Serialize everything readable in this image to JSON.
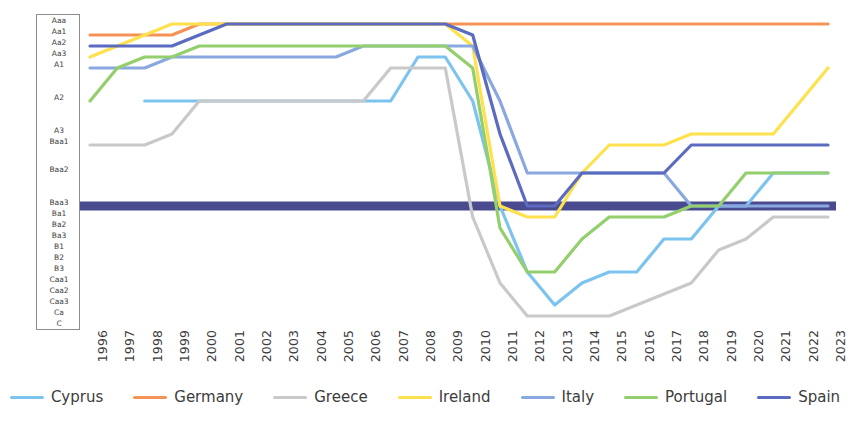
{
  "chart_data": {
    "type": "line",
    "title": "",
    "subtitle": "",
    "xlabel": "",
    "ylabel": "",
    "grid": false,
    "legend_position": "bottom",
    "x": [
      "1996",
      "1997",
      "1998",
      "1999",
      "2000",
      "2001",
      "2002",
      "2003",
      "2004",
      "2005",
      "2006",
      "2007",
      "2008",
      "2009",
      "2010",
      "2011",
      "2012",
      "2013",
      "2014",
      "2015",
      "2016",
      "2017",
      "2018",
      "2019",
      "2020",
      "2021",
      "2022",
      "2023"
    ],
    "y_categories": [
      "Aaa",
      "Aa1",
      "Aa2",
      "Aa3",
      "A1",
      "A2",
      "A3",
      "Baa1",
      "Baa2",
      "Baa3",
      "Ba1",
      "Ba2",
      "Ba3",
      "B1",
      "B2",
      "B3",
      "Caa1",
      "Caa2",
      "Caa3",
      "Ca",
      "C"
    ],
    "y_label_rows": [
      {
        "label": "Aaa",
        "y": 20
      },
      {
        "label": "Aa1",
        "y": 31
      },
      {
        "label": "Aa2",
        "y": 42
      },
      {
        "label": "Aa3",
        "y": 53
      },
      {
        "label": "A1",
        "y": 64
      },
      {
        "label": "A2",
        "y": 97
      },
      {
        "label": "A3",
        "y": 130
      },
      {
        "label": "Baa1",
        "y": 141
      },
      {
        "label": "Baa2",
        "y": 169
      },
      {
        "label": "Baa3",
        "y": 202
      },
      {
        "label": "Ba1",
        "y": 213
      },
      {
        "label": "Ba2",
        "y": 224
      },
      {
        "label": "Ba3",
        "y": 235
      },
      {
        "label": "B1",
        "y": 246
      },
      {
        "label": "B2",
        "y": 257
      },
      {
        "label": "B3",
        "y": 268
      },
      {
        "label": "Caa1",
        "y": 279
      },
      {
        "label": "Caa2",
        "y": 290
      },
      {
        "label": "Caa3",
        "y": 301
      },
      {
        "label": "Ca",
        "y": 312
      },
      {
        "label": "C",
        "y": 323
      }
    ],
    "series": [
      {
        "name": "Cyprus",
        "color": "#7cc4ef",
        "values": [
          null,
          null,
          "A2",
          "A2",
          "A2",
          "A2",
          "A2",
          "A2",
          "A2",
          "A2",
          "A2",
          "A2",
          "Aa3",
          "Aa3",
          "A2",
          "Baa3",
          "B3",
          "Caa3",
          "Caa1",
          "B3",
          "B3",
          "Ba3",
          "Ba3",
          "Baa3",
          "Baa3",
          "Baa2",
          "Baa2",
          "Baa2"
        ]
      },
      {
        "name": "Germany",
        "color": "#f59356",
        "values": [
          "Aa1",
          "Aa1",
          "Aa1",
          "Aa1",
          "Aaa",
          "Aaa",
          "Aaa",
          "Aaa",
          "Aaa",
          "Aaa",
          "Aaa",
          "Aaa",
          "Aaa",
          "Aaa",
          "Aaa",
          "Aaa",
          "Aaa",
          "Aaa",
          "Aaa",
          "Aaa",
          "Aaa",
          "Aaa",
          "Aaa",
          "Aaa",
          "Aaa",
          "Aaa",
          "Aaa",
          "Aaa"
        ]
      },
      {
        "name": "Greece",
        "color": "#c9c9c9",
        "values": [
          "Baa1",
          "Baa1",
          "Baa1",
          "A3",
          "A2",
          "A2",
          "A2",
          "A2",
          "A2",
          "A2",
          "A2",
          "A1",
          "A1",
          "A1",
          "Ba1",
          "Caa1",
          "Ca",
          "Ca",
          "Ca",
          "Ca",
          "Caa3",
          "Caa2",
          "Caa1",
          "B1",
          "Ba3",
          "Ba1",
          "Ba1",
          "Ba1"
        ]
      },
      {
        "name": "Ireland",
        "color": "#ffe14d",
        "values": [
          "Aa3",
          "Aa2",
          "Aa1",
          "Aaa",
          "Aaa",
          "Aaa",
          "Aaa",
          "Aaa",
          "Aaa",
          "Aaa",
          "Aaa",
          "Aaa",
          "Aaa",
          "Aaa",
          "Aa2",
          "Baa3",
          "Ba1",
          "Ba1",
          "Baa2",
          "Baa1",
          "Baa1",
          "Baa1",
          "A3",
          "A3",
          "A3",
          "A3",
          "A2",
          "A1"
        ]
      },
      {
        "name": "Italy",
        "color": "#8aa8e0",
        "values": [
          "A1",
          "A1",
          "A1",
          "Aa3",
          "Aa3",
          "Aa3",
          "Aa3",
          "Aa3",
          "Aa3",
          "Aa3",
          "Aa2",
          "Aa2",
          "Aa2",
          "Aa2",
          "Aa2",
          "A2",
          "Baa2",
          "Baa2",
          "Baa2",
          "Baa2",
          "Baa2",
          "Baa2",
          "Baa3",
          "Baa3",
          "Baa3",
          "Baa3",
          "Baa3",
          "Baa3"
        ]
      },
      {
        "name": "Portugal",
        "color": "#93cf6d",
        "values": [
          "A2",
          "A1",
          "Aa3",
          "Aa3",
          "Aa2",
          "Aa2",
          "Aa2",
          "Aa2",
          "Aa2",
          "Aa2",
          "Aa2",
          "Aa2",
          "Aa2",
          "Aa2",
          "A1",
          "Ba2",
          "B3",
          "B3",
          "Ba3",
          "Ba1",
          "Ba1",
          "Ba1",
          "Baa3",
          "Baa3",
          "Baa2",
          "Baa2",
          "Baa2",
          "Baa2"
        ]
      },
      {
        "name": "Spain",
        "color": "#5b6bbf",
        "values": [
          "Aa2",
          "Aa2",
          "Aa2",
          "Aa2",
          "Aa1",
          "Aaa",
          "Aaa",
          "Aaa",
          "Aaa",
          "Aaa",
          "Aaa",
          "Aaa",
          "Aaa",
          "Aaa",
          "Aa1",
          "A3",
          "Baa3",
          "Baa3",
          "Baa2",
          "Baa2",
          "Baa2",
          "Baa2",
          "Baa1",
          "Baa1",
          "Baa1",
          "Baa1",
          "Baa1",
          "Baa1"
        ]
      }
    ],
    "investment_grade_band": {
      "label": "Baa3",
      "color": "#4a4a8f"
    }
  },
  "legend": {
    "items": [
      {
        "label": "Cyprus",
        "color": "#7cc4ef"
      },
      {
        "label": "Germany",
        "color": "#f59356"
      },
      {
        "label": "Greece",
        "color": "#c9c9c9"
      },
      {
        "label": "Ireland",
        "color": "#ffe14d"
      },
      {
        "label": "Italy",
        "color": "#8aa8e0"
      },
      {
        "label": "Portugal",
        "color": "#93cf6d"
      },
      {
        "label": "Spain",
        "color": "#5b6bbf"
      }
    ]
  }
}
